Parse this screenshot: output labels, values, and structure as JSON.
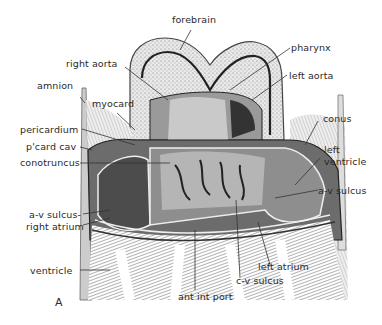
{
  "figure": {
    "panel_label": "A",
    "labels": {
      "forebrain": "forebrain",
      "right_aorta": "right aorta",
      "pharynx": "pharynx",
      "left_aorta": "left aorta",
      "amnion": "amnion",
      "myocard": "myocard",
      "conus": "conus",
      "pericardium": "pericardium",
      "pcard_cav": "p'card cav",
      "conotruncus": "conotruncus",
      "left_ventricle": "left\nventricle",
      "left_ventricle_l1": "left",
      "left_ventricle_l2": "ventricle",
      "av_sulcus_right": "a-v sulcus",
      "av_sulcus_left": "a-v sulcus-",
      "right_atrium": "right atrium",
      "ventricle": "ventricle",
      "left_atrium": "left atrium",
      "cv_sulcus": "c-v sulcus",
      "ant_int_port": "ant int port"
    }
  }
}
